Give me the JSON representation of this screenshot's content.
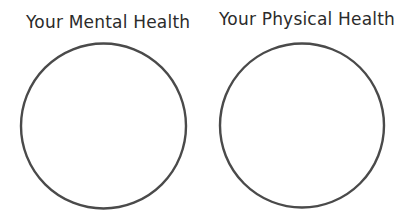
{
  "diagram": {
    "panels": [
      {
        "title": "Your Mental Health",
        "circle": {
          "cx": 103.5,
          "cy": 126,
          "r": 82.5
        }
      },
      {
        "title": "Your Physical Health",
        "circle": {
          "cx": 302,
          "cy": 125.5,
          "r": 82
        }
      }
    ],
    "colors": {
      "stroke": "#4a4a4a",
      "text": "#2b2b2b",
      "background": "#ffffff"
    }
  }
}
